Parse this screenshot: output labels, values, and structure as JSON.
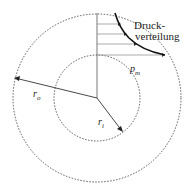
{
  "diagram": {
    "label_pressure": "Druck-",
    "label_pressure2": "verteilung",
    "label_pm": "p",
    "label_pm_sub": "m",
    "label_ro": "r",
    "label_ro_sub": "o",
    "label_ri": "r",
    "label_ri_sub": "i"
  }
}
